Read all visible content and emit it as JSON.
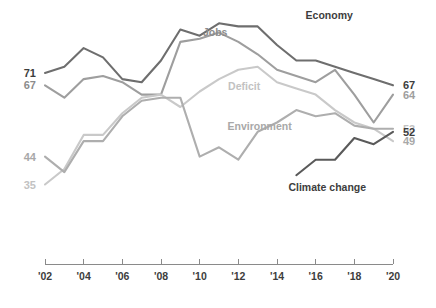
{
  "chart_data": {
    "type": "line",
    "title": "",
    "subtitle": "",
    "xlabel": "",
    "ylabel": "",
    "grid": false,
    "legend_position": "inline-annotations",
    "x": [
      2002,
      2003,
      2004,
      2005,
      2006,
      2007,
      2008,
      2009,
      2010,
      2011,
      2012,
      2013,
      2014,
      2015,
      2016,
      2017,
      2018,
      2019,
      2020
    ],
    "xlim": [
      2002,
      2020
    ],
    "ylim": [
      30,
      90
    ],
    "tick_labels": [
      "'02",
      "'04",
      "'06",
      "'08",
      "'10",
      "'12",
      "'14",
      "'16",
      "'18",
      "'20"
    ],
    "tick_values": [
      2002,
      2004,
      2006,
      2008,
      2010,
      2012,
      2014,
      2016,
      2018,
      2020
    ],
    "series": [
      {
        "name": "Economy",
        "color": "#6e6e6e",
        "label_color": "#3d3d3d",
        "start_label": "71",
        "end_label": "67",
        "start_label_bold": true,
        "end_label_bold": true,
        "values": [
          71,
          73,
          79,
          76,
          69,
          68,
          75,
          85,
          83,
          87,
          86,
          86,
          80,
          75,
          75,
          73,
          71,
          69,
          67
        ]
      },
      {
        "name": "Jobs",
        "color": "#9e9e9e",
        "label_color": "#8c8c8c",
        "start_label": "67",
        "end_label": "64",
        "start_label_bold": false,
        "end_label_bold": false,
        "values": [
          67,
          63,
          69,
          70,
          68,
          64,
          64,
          81,
          82,
          84,
          81,
          77,
          72,
          70,
          68,
          72,
          64,
          55,
          64
        ]
      },
      {
        "name": "Deficit",
        "color": "#c9c9c9",
        "label_color": "#b8b8b8",
        "start_label": "35",
        "end_label": "49",
        "start_label_bold": false,
        "end_label_bold": false,
        "values": [
          35,
          40,
          51,
          51,
          58,
          63,
          64,
          60,
          65,
          69,
          72,
          73,
          68,
          66,
          64,
          59,
          55,
          53,
          49
        ]
      },
      {
        "name": "Environment",
        "color": "#aeaeae",
        "label_color": "#9e9e9e",
        "start_label": "44",
        "end_label": "53",
        "start_label_bold": false,
        "end_label_bold": false,
        "values": [
          44,
          39,
          49,
          49,
          57,
          62,
          63,
          63,
          44,
          47,
          43,
          52,
          55,
          59,
          57,
          58,
          54,
          53,
          53
        ]
      },
      {
        "name": "Climate change",
        "color": "#5a5a5a",
        "label_color": "#3d3d3d",
        "start_label": "",
        "end_label": "52",
        "start_label_bold": false,
        "end_label_bold": true,
        "values": [
          null,
          null,
          null,
          null,
          null,
          null,
          null,
          null,
          null,
          null,
          null,
          null,
          null,
          38,
          43,
          43,
          50,
          48,
          52
        ]
      }
    ],
    "annotations": [
      {
        "text": "Economy",
        "x": 2016.7,
        "y": 88.5,
        "color": "#3d3d3d"
      },
      {
        "text": "Jobs",
        "x": 2010.8,
        "y": 83.0,
        "color": "#8c8c8c"
      },
      {
        "text": "Deficit",
        "x": 2012.3,
        "y": 65.5,
        "color": "#c2c2c2"
      },
      {
        "text": "Environment",
        "x": 2013.1,
        "y": 52.5,
        "color": "#a8a8a8"
      },
      {
        "text": "Climate change",
        "x": 2016.6,
        "y": 33.0,
        "color": "#3d3d3d"
      }
    ],
    "left_labels": [
      {
        "text": "71",
        "value": 71,
        "color": "#3d3d3d",
        "bold": true
      },
      {
        "text": "67",
        "value": 67,
        "color": "#8c8c8c",
        "bold": true
      },
      {
        "text": "44",
        "value": 44,
        "color": "#a8a8a8",
        "bold": true
      },
      {
        "text": "35",
        "value": 35,
        "color": "#c2c2c2",
        "bold": true
      }
    ],
    "right_labels": [
      {
        "text": "67",
        "value": 67,
        "color": "#3d3d3d",
        "bold": true
      },
      {
        "text": "64",
        "value": 64,
        "color": "#9e9e9e",
        "bold": true
      },
      {
        "text": "53",
        "value": 53,
        "color": "#c2c2c2",
        "bold": true
      },
      {
        "text": "52",
        "value": 52,
        "color": "#3d3d3d",
        "bold": true
      },
      {
        "text": "49",
        "value": 49,
        "color": "#a8a8a8",
        "bold": true
      }
    ]
  }
}
